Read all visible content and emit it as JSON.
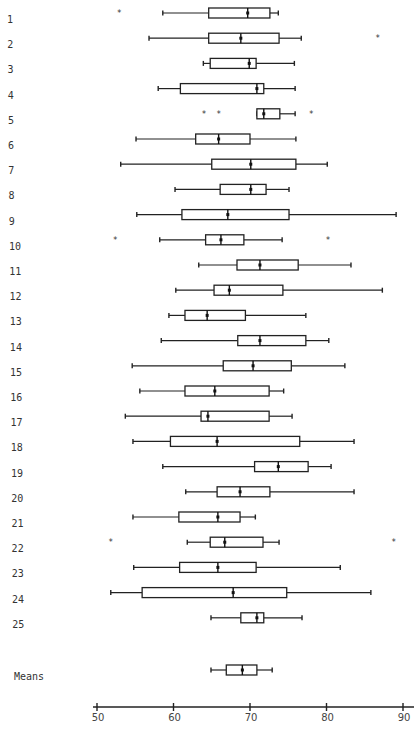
{
  "chart_data": {
    "type": "boxplot",
    "orientation": "horizontal",
    "title": "",
    "xlabel": "",
    "ylabel": "",
    "xlim": [
      50,
      90
    ],
    "xticks": [
      50,
      60,
      70,
      80,
      90
    ],
    "xtick_labels": [
      "50",
      "60",
      "70",
      "80",
      "90"
    ],
    "grid": false,
    "legend": "none",
    "outlier_marker": "*",
    "series": [
      {
        "label": "1",
        "whisker_low": 58.6,
        "q1": 64.6,
        "median": 69.7,
        "q3": 72.6,
        "whisker_high": 73.7,
        "outliers": [
          52.9
        ]
      },
      {
        "label": "2",
        "whisker_low": 56.8,
        "q1": 64.6,
        "median": 68.8,
        "q3": 73.8,
        "whisker_high": 76.7,
        "outliers": [
          86.7
        ]
      },
      {
        "label": "3",
        "whisker_low": 63.9,
        "q1": 64.8,
        "median": 69.9,
        "q3": 70.8,
        "whisker_high": 75.8,
        "outliers": []
      },
      {
        "label": "4",
        "whisker_low": 58.0,
        "q1": 60.9,
        "median": 70.9,
        "q3": 71.8,
        "whisker_high": 75.9,
        "outliers": []
      },
      {
        "label": "5",
        "whisker_low": 70.9,
        "q1": 70.9,
        "median": 71.8,
        "q3": 73.9,
        "whisker_high": 75.9,
        "outliers": [
          64.0,
          65.9,
          78.0
        ]
      },
      {
        "label": "6",
        "whisker_low": 55.1,
        "q1": 62.9,
        "median": 65.9,
        "q3": 70.0,
        "whisker_high": 76.0,
        "outliers": []
      },
      {
        "label": "7",
        "whisker_low": 53.1,
        "q1": 65.0,
        "median": 70.1,
        "q3": 76.0,
        "whisker_high": 80.1,
        "outliers": []
      },
      {
        "label": "8",
        "whisker_low": 60.2,
        "q1": 66.1,
        "median": 70.1,
        "q3": 72.1,
        "whisker_high": 75.1,
        "outliers": []
      },
      {
        "label": "9",
        "whisker_low": 55.2,
        "q1": 61.1,
        "median": 67.1,
        "q3": 75.1,
        "whisker_high": 89.1,
        "outliers": []
      },
      {
        "label": "10",
        "whisker_low": 58.2,
        "q1": 64.2,
        "median": 66.2,
        "q3": 69.2,
        "whisker_high": 74.2,
        "outliers": [
          52.4,
          80.2
        ]
      },
      {
        "label": "11",
        "whisker_low": 63.3,
        "q1": 68.3,
        "median": 71.3,
        "q3": 76.3,
        "whisker_high": 83.2,
        "outliers": []
      },
      {
        "label": "12",
        "whisker_low": 60.3,
        "q1": 65.3,
        "median": 67.3,
        "q3": 74.3,
        "whisker_high": 87.3,
        "outliers": []
      },
      {
        "label": "13",
        "whisker_low": 59.4,
        "q1": 61.5,
        "median": 64.4,
        "q3": 69.4,
        "whisker_high": 77.3,
        "outliers": []
      },
      {
        "label": "14",
        "whisker_low": 58.4,
        "q1": 68.4,
        "median": 71.3,
        "q3": 77.3,
        "whisker_high": 80.3,
        "outliers": []
      },
      {
        "label": "15",
        "whisker_low": 54.6,
        "q1": 66.5,
        "median": 70.4,
        "q3": 75.4,
        "whisker_high": 82.4,
        "outliers": []
      },
      {
        "label": "16",
        "whisker_low": 55.6,
        "q1": 61.5,
        "median": 65.4,
        "q3": 72.5,
        "whisker_high": 74.4,
        "outliers": []
      },
      {
        "label": "17",
        "whisker_low": 53.7,
        "q1": 63.6,
        "median": 64.5,
        "q3": 72.5,
        "whisker_high": 75.5,
        "outliers": []
      },
      {
        "label": "18",
        "whisker_low": 54.7,
        "q1": 59.6,
        "median": 65.7,
        "q3": 76.5,
        "whisker_high": 83.6,
        "outliers": []
      },
      {
        "label": "19",
        "whisker_low": 58.6,
        "q1": 70.6,
        "median": 73.7,
        "q3": 77.6,
        "whisker_high": 80.6,
        "outliers": []
      },
      {
        "label": "20",
        "whisker_low": 61.6,
        "q1": 65.7,
        "median": 68.7,
        "q3": 72.6,
        "whisker_high": 83.6,
        "outliers": []
      },
      {
        "label": "21",
        "whisker_low": 54.7,
        "q1": 60.7,
        "median": 65.8,
        "q3": 68.7,
        "whisker_high": 70.7,
        "outliers": []
      },
      {
        "label": "22",
        "whisker_low": 61.8,
        "q1": 64.8,
        "median": 66.7,
        "q3": 71.7,
        "whisker_high": 73.8,
        "outliers": [
          51.8,
          88.8
        ]
      },
      {
        "label": "23",
        "whisker_low": 54.8,
        "q1": 60.8,
        "median": 65.8,
        "q3": 70.8,
        "whisker_high": 81.8,
        "outliers": []
      },
      {
        "label": "24",
        "whisker_low": 51.8,
        "q1": 55.9,
        "median": 67.8,
        "q3": 74.8,
        "whisker_high": 85.8,
        "outliers": []
      },
      {
        "label": "25",
        "whisker_low": 64.9,
        "q1": 68.8,
        "median": 70.9,
        "q3": 71.8,
        "whisker_high": 76.8,
        "outliers": []
      },
      {
        "label": "Means",
        "whisker_low": 64.9,
        "q1": 66.9,
        "median": 69.0,
        "q3": 70.9,
        "whisker_high": 72.9,
        "outliers": []
      }
    ]
  }
}
